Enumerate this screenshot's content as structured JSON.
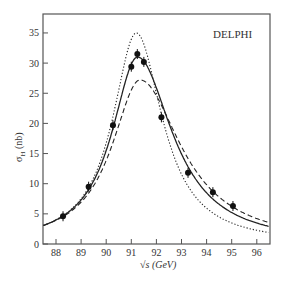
{
  "chart_data": {
    "type": "line",
    "title": "",
    "annotation": "DELPHI",
    "xlabel": "√s (GeV)",
    "ylabel": "σH (nb)",
    "ylabel_main": "σ",
    "ylabel_sub": "H",
    "ylabel_unit": " (nb)",
    "xlim": [
      87.5,
      96.5
    ],
    "ylim": [
      0,
      37.5
    ],
    "xticks": [
      88,
      89,
      90,
      91,
      92,
      93,
      94,
      95,
      96
    ],
    "yticks": [
      0,
      5,
      10,
      15,
      20,
      25,
      30,
      35
    ],
    "grid": false,
    "legend": "none",
    "series": [
      {
        "name": "data",
        "style": "points",
        "x": [
          88.28,
          89.3,
          90.27,
          91.0,
          91.24,
          91.5,
          92.2,
          93.26,
          94.25,
          95.05
        ],
        "y": [
          4.6,
          9.5,
          19.7,
          29.4,
          31.5,
          30.2,
          21.0,
          11.8,
          8.6,
          6.3
        ]
      },
      {
        "name": "fit",
        "style": "solid",
        "peak_x": 91.25,
        "peak_y": 31.0,
        "gamma": 2.5,
        "asym": 0.35
      },
      {
        "name": "no radiative corrections",
        "style": "dotted",
        "peak_x": 91.2,
        "peak_y": 35.0,
        "gamma": 2.3,
        "asym": 0.1
      },
      {
        "name": "alternate",
        "style": "dashed",
        "peak_x": 91.35,
        "peak_y": 27.2,
        "gamma": 2.75,
        "asym": 0.45
      }
    ]
  }
}
